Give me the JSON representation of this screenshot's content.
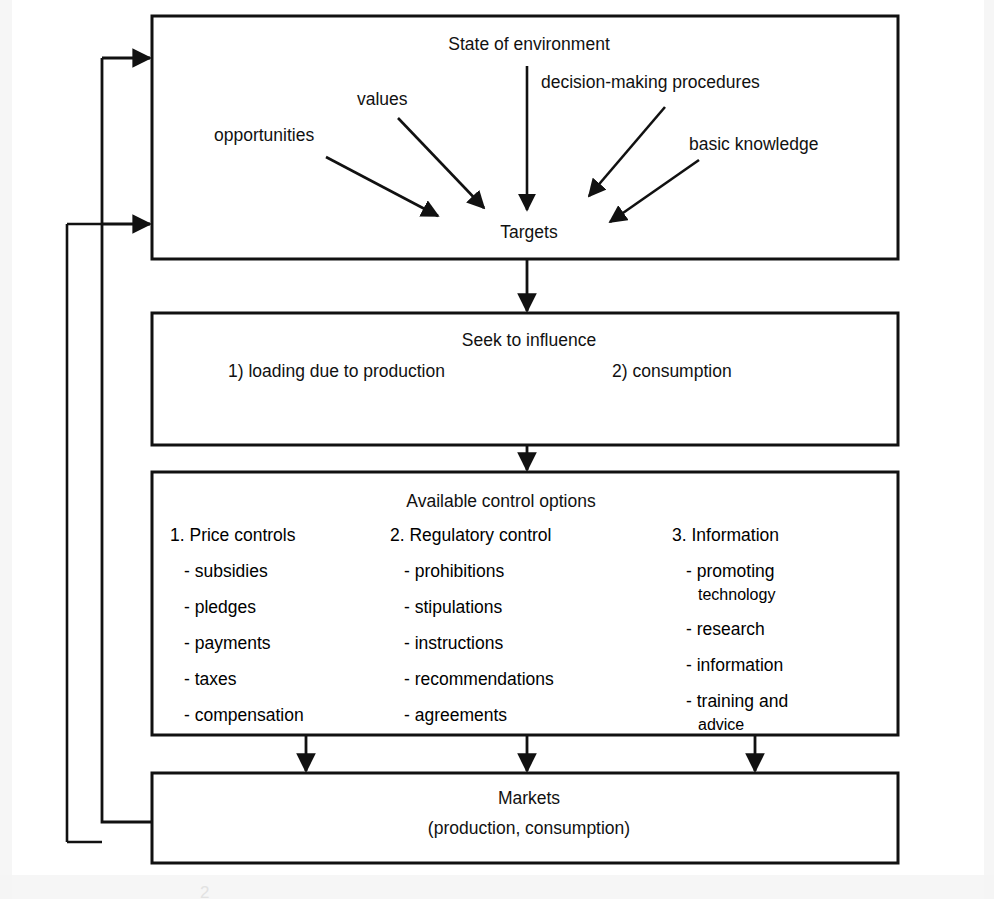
{
  "diagram": {
    "title_hidden_caption": "2",
    "boxes": [
      {
        "id": "state-of-environment",
        "title": "State of environment",
        "center_node": "Targets",
        "inputs": [
          "opportunities",
          "values",
          "decision-making procedures",
          "basic knowledge"
        ]
      },
      {
        "id": "seek-to-influence",
        "title": "Seek to influence",
        "items": [
          "1) loading due to production",
          "2) consumption"
        ]
      },
      {
        "id": "available-control-options",
        "title": "Available control options",
        "columns": [
          {
            "heading": "1. Price controls",
            "items": [
              "- subsidies",
              "- pledges",
              "- payments",
              "- taxes",
              "- compensation"
            ]
          },
          {
            "heading": "2. Regulatory control",
            "items": [
              "- prohibitions",
              "- stipulations",
              "- instructions",
              "- recommendations",
              "- agreements"
            ]
          },
          {
            "heading": "3. Information",
            "items": [
              "- promoting",
              "technology",
              "- research",
              "- information",
              "- training and",
              "advice"
            ]
          }
        ]
      },
      {
        "id": "markets",
        "title": "Markets",
        "subtitle": "(production, consumption)"
      }
    ],
    "colors": {
      "stroke": "#111111",
      "text": "#111111",
      "background": "#ffffff"
    }
  }
}
